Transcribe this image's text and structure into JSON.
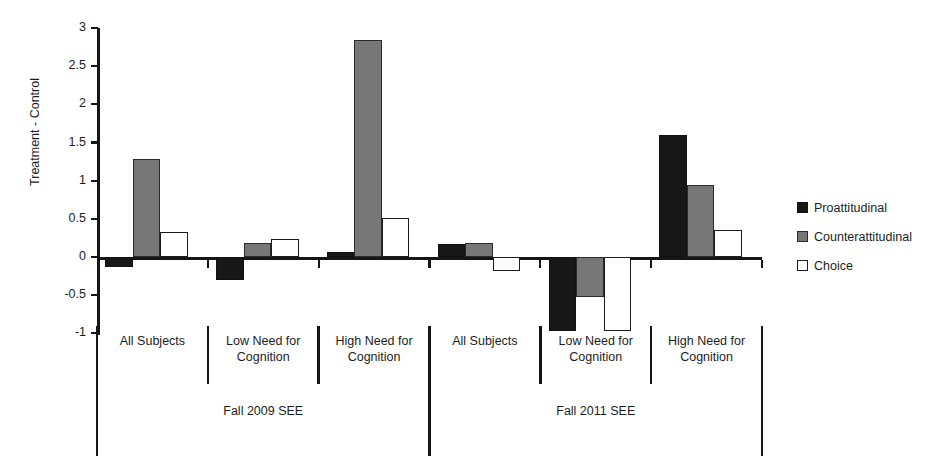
{
  "chart_data": {
    "type": "bar",
    "title": "",
    "subtitle": "",
    "xlabel": "",
    "ylabel": "Treatment - Control",
    "ylim": [
      -1.25,
      3.0
    ],
    "yticks": [
      3,
      2.5,
      2,
      1.5,
      1,
      0.5,
      0,
      -0.5,
      -1
    ],
    "ytick_labels": [
      "3",
      "2.5",
      "2",
      "1.5",
      "1",
      "0.5",
      "0",
      "-0.5",
      "-1"
    ],
    "grid": false,
    "legend_position": "right",
    "categories": [
      "All Subjects",
      "Low Need for Cognition",
      "High Need for Cognition",
      "All Subjects",
      "Low Need for Cognition",
      "High Need for Cognition"
    ],
    "category_lines": [
      [
        "All Subjects"
      ],
      [
        "Low Need for",
        "Cognition"
      ],
      [
        "High Need for",
        "Cognition"
      ],
      [
        "All Subjects"
      ],
      [
        "Low Need for",
        "Cognition"
      ],
      [
        "High Need for",
        "Cognition"
      ]
    ],
    "groups": [
      {
        "label": "Fall 2009 SEE",
        "categories": [
          0,
          1,
          2
        ]
      },
      {
        "label": "Fall 2011 SEE",
        "categories": [
          3,
          4,
          5
        ]
      }
    ],
    "series": [
      {
        "name": "Proattitudinal",
        "color": "#171717",
        "values": [
          -0.13,
          -0.3,
          0.06,
          0.17,
          -0.97,
          1.6
        ]
      },
      {
        "name": "Counterattitudinal",
        "color": "#777777",
        "values": [
          1.28,
          0.19,
          2.85,
          0.18,
          -0.52,
          0.95
        ]
      },
      {
        "name": "Choice",
        "color": "#ffffff",
        "values": [
          0.33,
          0.24,
          0.51,
          -0.18,
          -0.97,
          0.35
        ]
      }
    ]
  },
  "legend": {
    "items": [
      {
        "label": "Proattitudinal"
      },
      {
        "label": "Counterattitudinal"
      },
      {
        "label": "Choice"
      }
    ]
  }
}
